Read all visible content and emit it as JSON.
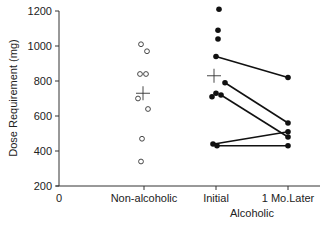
{
  "chart_data": {
    "type": "scatter",
    "title": "",
    "xlabel": "Alcoholic",
    "ylabel": "Dose Requirement (mg)",
    "ylim": [
      200,
      1200
    ],
    "yticks": [
      200,
      400,
      600,
      800,
      1000,
      1200
    ],
    "xticks": [
      "0",
      "Non-alcoholic",
      "Initial",
      "1 Mo.Later"
    ],
    "grid": false,
    "legend": null,
    "series": [
      {
        "name": "Non-alcoholic",
        "marker": "open-circle",
        "category": "Non-alcoholic",
        "values": [
          1010,
          970,
          840,
          840,
          700,
          640,
          470,
          340
        ],
        "mean": 730
      },
      {
        "name": "Alcoholic Initial",
        "marker": "filled-circle",
        "category": "Initial",
        "values": [
          1210,
          1090,
          1040,
          940,
          790,
          730,
          710,
          720,
          440,
          430
        ],
        "mean": 830
      },
      {
        "name": "Alcoholic 1 Mo.Later",
        "marker": "filled-circle",
        "category": "1 Mo.Later",
        "values": [
          820,
          560,
          510,
          480,
          430
        ]
      }
    ],
    "paired_lines": [
      {
        "initial": 940,
        "later": 820
      },
      {
        "initial": 790,
        "later": 560
      },
      {
        "initial": 720,
        "later": 480
      },
      {
        "initial": 440,
        "later": 510
      },
      {
        "initial": 430,
        "later": 430
      }
    ]
  }
}
